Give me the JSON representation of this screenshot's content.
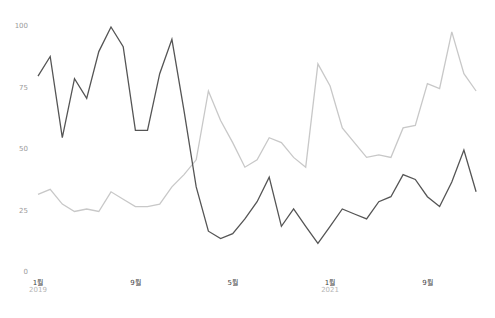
{
  "chart_data": {
    "type": "line",
    "title": "",
    "xlabel": "",
    "ylabel": "",
    "ylim": [
      0,
      100
    ],
    "grid": false,
    "legend": null,
    "y_ticks": [
      "0",
      "25",
      "50",
      "75",
      "100"
    ],
    "x_tick_labels": [
      {
        "index": 0,
        "month": "1월",
        "year": "2019"
      },
      {
        "index": 8,
        "month": "9월",
        "year": ""
      },
      {
        "index": 16,
        "month": "5월",
        "year": ""
      },
      {
        "index": 24,
        "month": "1월",
        "year": "2021"
      },
      {
        "index": 32,
        "month": "9월",
        "year": ""
      }
    ],
    "x": [
      "2019-01",
      "2019-02",
      "2019-03",
      "2019-04",
      "2019-05",
      "2019-06",
      "2019-07",
      "2019-08",
      "2019-09",
      "2019-10",
      "2019-11",
      "2019-12",
      "2020-01",
      "2020-02",
      "2020-03",
      "2020-04",
      "2020-05",
      "2020-06",
      "2020-07",
      "2020-08",
      "2020-09",
      "2020-10",
      "2020-11",
      "2020-12",
      "2021-01",
      "2021-02",
      "2021-03",
      "2021-04",
      "2021-05",
      "2021-06",
      "2021-07",
      "2021-08",
      "2021-09",
      "2021-10",
      "2021-11",
      "2021-12",
      "2022-01"
    ],
    "series": [
      {
        "name": "series-dark",
        "color": "#555555",
        "values": [
          80,
          88,
          55,
          79,
          71,
          90,
          100,
          92,
          58,
          58,
          81,
          95,
          66,
          35,
          17,
          14,
          16,
          22,
          29,
          39,
          19,
          26,
          19,
          12,
          19,
          26,
          24,
          22,
          29,
          31,
          40,
          38,
          31,
          27,
          37,
          50,
          33
        ]
      },
      {
        "name": "series-light",
        "color": "#c8c8c8",
        "values": [
          32,
          34,
          28,
          25,
          26,
          25,
          33,
          30,
          27,
          27,
          28,
          35,
          40,
          46,
          74,
          62,
          53,
          43,
          46,
          55,
          53,
          47,
          43,
          85,
          76,
          59,
          53,
          47,
          48,
          47,
          59,
          60,
          77,
          75,
          98,
          81,
          74
        ]
      }
    ]
  }
}
